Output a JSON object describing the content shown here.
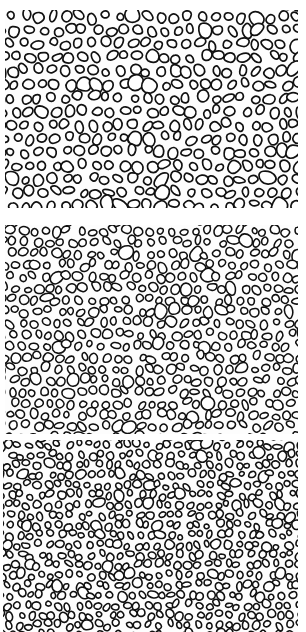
{
  "figure": {
    "background": "#ffffff",
    "stroke_color": "#111111",
    "panels": [
      {
        "id": "top",
        "label": "",
        "x": 5,
        "y": 10,
        "w": 293,
        "h": 198,
        "cell_size": 13.5,
        "stroke": 1.7,
        "seed": 11,
        "jitter": 0.38
      },
      {
        "id": "middle",
        "label": "",
        "x": 5,
        "y": 225,
        "w": 293,
        "h": 209,
        "cell_size": 11.5,
        "stroke": 1.55,
        "seed": 29,
        "jitter": 0.45
      },
      {
        "id": "bottom",
        "label": "",
        "x": 3,
        "y": 440,
        "w": 295,
        "h": 192,
        "cell_size": 10.0,
        "stroke": 1.6,
        "seed": 53,
        "jitter": 0.5
      }
    ]
  }
}
